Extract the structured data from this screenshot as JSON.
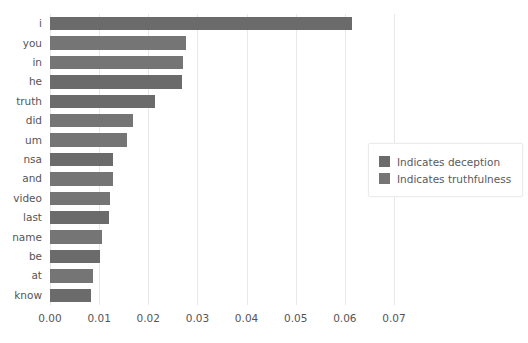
{
  "chart_data": {
    "type": "bar",
    "orientation": "horizontal",
    "title": "",
    "xlabel": "",
    "ylabel": "",
    "xlim": [
      0.0,
      0.07
    ],
    "xticks": [
      "0.00",
      "0.01",
      "0.02",
      "0.03",
      "0.04",
      "0.05",
      "0.06",
      "0.07"
    ],
    "xtick_values": [
      0.0,
      0.01,
      0.02,
      0.03,
      0.04,
      0.05,
      0.06,
      0.07
    ],
    "grid": "vertical",
    "categories": [
      "i",
      "you",
      "in",
      "he",
      "truth",
      "did",
      "um",
      "nsa",
      "and",
      "video",
      "last",
      "name",
      "be",
      "at",
      "know"
    ],
    "values": [
      0.0614,
      0.0277,
      0.0271,
      0.0269,
      0.0214,
      0.0169,
      0.0157,
      0.0129,
      0.0129,
      0.0122,
      0.012,
      0.0106,
      0.0102,
      0.0088,
      0.0084
    ],
    "bar_classes": [
      "deception",
      "truthfulness",
      "truthfulness",
      "deception",
      "deception",
      "truthfulness",
      "truthfulness",
      "deception",
      "truthfulness",
      "truthfulness",
      "deception",
      "truthfulness",
      "deception",
      "truthfulness",
      "deception"
    ],
    "legend": {
      "position": "right",
      "entries": [
        {
          "label": "Indicates deception",
          "color": "#6b6b6b"
        },
        {
          "label": "Indicates truthfulness",
          "color": "#757575"
        }
      ]
    },
    "colors": {
      "deception": "#6b6b6b",
      "truthfulness": "#757575",
      "grid": "#e8e8e8",
      "text": "#555555",
      "background": "#ffffff"
    }
  }
}
